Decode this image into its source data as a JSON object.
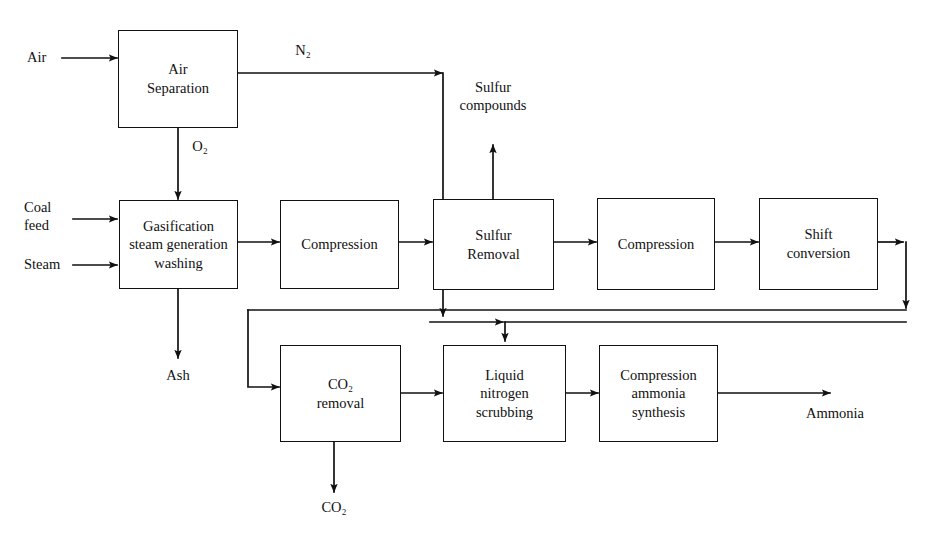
{
  "diagram": {
    "type": "process-flow-diagram",
    "line_color": "#111111",
    "background_color": "#ffffff",
    "boxes": [
      {
        "id": "air-separation",
        "label": "Air\nSeparation"
      },
      {
        "id": "gasification",
        "label": "Gasification\nsteam generation\nwashing"
      },
      {
        "id": "compression-1",
        "label": "Compression"
      },
      {
        "id": "sulfur-removal",
        "label": "Sulfur\nRemoval"
      },
      {
        "id": "compression-2",
        "label": "Compression"
      },
      {
        "id": "shift-conversion",
        "label": "Shift\nconversion"
      },
      {
        "id": "co2-removal",
        "label": "CO₂\nremoval"
      },
      {
        "id": "liquid-nitrogen-scrubbing",
        "label": "Liquid\nnitrogen\nscrubbing"
      },
      {
        "id": "compression-ammonia-synthesis",
        "label": "Compression\nammonia\nsynthesis"
      }
    ],
    "streams": [
      {
        "id": "air",
        "label": "Air"
      },
      {
        "id": "coal-feed",
        "label": "Coal\nfeed"
      },
      {
        "id": "steam",
        "label": "Steam"
      },
      {
        "id": "nitrogen",
        "label": "N₂"
      },
      {
        "id": "oxygen",
        "label": "O₂"
      },
      {
        "id": "sulfur-compounds",
        "label": "Sulfur\ncompounds"
      },
      {
        "id": "ash",
        "label": "Ash"
      },
      {
        "id": "carbon-dioxide",
        "label": "CO₂"
      },
      {
        "id": "ammonia",
        "label": "Ammonia"
      }
    ]
  }
}
